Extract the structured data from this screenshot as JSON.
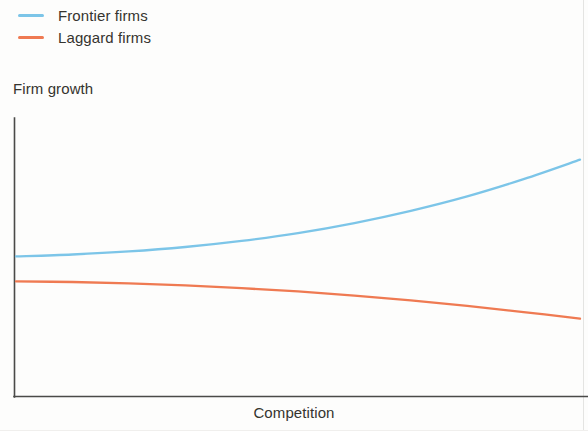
{
  "chart_data": {
    "type": "line",
    "title": "",
    "subtitle": "",
    "xlabel": "Competition",
    "ylabel": "Firm growth",
    "grid": false,
    "legend_position": "top-left",
    "axis_ticks": "none",
    "x_axis_units": "unlabeled (schematic)",
    "y_axis_units": "unlabeled (schematic)",
    "xlim": [
      0,
      100
    ],
    "ylim": [
      0,
      100
    ],
    "x": [
      0,
      10,
      20,
      30,
      40,
      50,
      60,
      70,
      80,
      90,
      100
    ],
    "series": [
      {
        "name": "Frontier firms",
        "color": "#7cc5e8",
        "values": [
          50.2,
          50.9,
          52.0,
          53.6,
          55.8,
          58.6,
          62.2,
          66.6,
          71.8,
          78.0,
          85.0
        ],
        "shape": "convex increasing"
      },
      {
        "name": "Laggard firms",
        "color": "#ef7a52",
        "values": [
          41.2,
          41.0,
          40.5,
          39.8,
          38.8,
          37.6,
          36.1,
          34.4,
          32.4,
          30.2,
          27.8
        ],
        "shape": "concave decreasing"
      }
    ]
  },
  "legend": {
    "items": [
      {
        "label": "Frontier firms",
        "color": "#7cc5e8"
      },
      {
        "label": "Laggard firms",
        "color": "#ef7a52"
      }
    ]
  },
  "axes": {
    "y_title": "Firm growth",
    "x_title": "Competition"
  }
}
